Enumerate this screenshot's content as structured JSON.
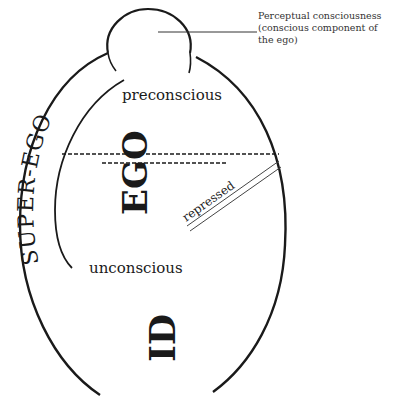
{
  "diagram": {
    "colors": {
      "stroke": "#1a1a1a",
      "background": "#ffffff",
      "text": "#222222"
    },
    "callout": {
      "line1": "Perceptual consciousness",
      "line2": "(conscious component of",
      "line3": "the ego)"
    },
    "labels": {
      "preconscious": "preconscious",
      "unconscious": "unconscious",
      "superego": "SUPER-EGO",
      "ego": "EGO",
      "id": "ID",
      "repressed": "repressed"
    },
    "regions": [
      {
        "name": "perceptual-consciousness",
        "shape": "circle-cap"
      },
      {
        "name": "preconscious",
        "boundary": "dashed line"
      },
      {
        "name": "unconscious",
        "boundary": "open bottom"
      }
    ]
  }
}
